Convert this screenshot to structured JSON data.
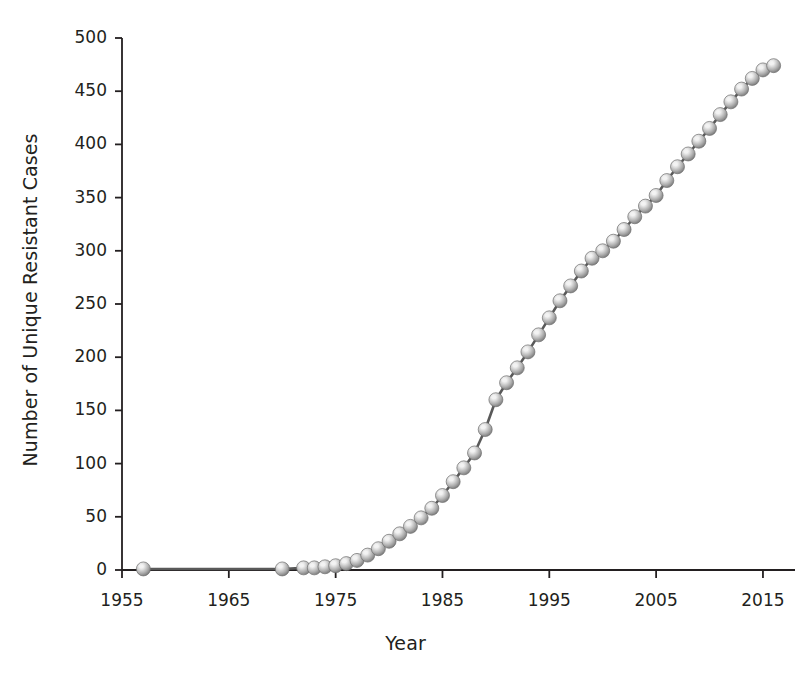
{
  "chart_data": {
    "type": "line",
    "title": "",
    "subtitle": "",
    "xlabel": "Year",
    "ylabel": "Number of Unique Resistant Cases",
    "xlim": [
      1955,
      1818
    ],
    "x_range": [
      1955,
      2018
    ],
    "ylim": [
      0,
      500
    ],
    "xticks": [
      1955,
      1965,
      1975,
      1985,
      1995,
      2005,
      2015
    ],
    "xtick_labels": [
      "1955",
      "1965",
      "1975",
      "1985",
      "1995",
      "2005",
      "2015"
    ],
    "yticks": [
      0,
      50,
      100,
      150,
      200,
      250,
      300,
      350,
      400,
      450,
      500
    ],
    "ytick_labels": [
      "0",
      "50",
      "100",
      "150",
      "200",
      "250",
      "300",
      "350",
      "400",
      "450",
      "500"
    ],
    "grid": false,
    "legend": null,
    "marker": "sphere",
    "marker_color": "#a8a8a8",
    "marker_highlight": "#f2f2f2",
    "marker_edge": "#6e6e6e",
    "line_color": "#595959",
    "axis_color": "#231f20",
    "background": "#ffffff",
    "series": [
      {
        "name": "Unique Resistant Cases",
        "x": [
          1957,
          1970,
          1972,
          1973,
          1974,
          1975,
          1976,
          1977,
          1978,
          1979,
          1980,
          1981,
          1982,
          1983,
          1984,
          1985,
          1986,
          1987,
          1988,
          1989,
          1990,
          1991,
          1992,
          1993,
          1994,
          1995,
          1996,
          1997,
          1998,
          1999,
          2000,
          2001,
          2002,
          2003,
          2004,
          2005,
          2006,
          2007,
          2008,
          2009,
          2010,
          2011,
          2012,
          2013,
          2014,
          2015,
          2016
        ],
        "values": [
          1,
          1,
          2,
          2,
          3,
          4,
          6,
          9,
          14,
          20,
          27,
          34,
          41,
          49,
          58,
          70,
          83,
          96,
          110,
          132,
          160,
          176,
          190,
          205,
          221,
          237,
          253,
          267,
          281,
          293,
          300,
          309,
          320,
          332,
          342,
          352,
          366,
          379,
          391,
          403,
          415,
          428,
          440,
          452,
          462,
          470,
          474
        ]
      }
    ]
  },
  "axis_titles": {
    "x": "Year",
    "y": "Number of Unique Resistant Cases"
  }
}
